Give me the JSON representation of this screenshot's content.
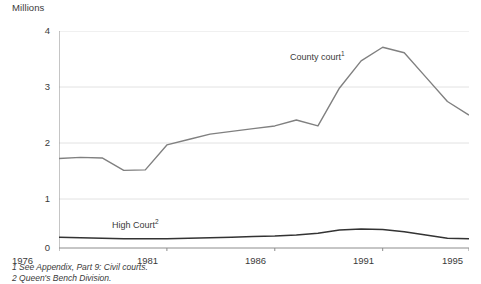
{
  "axis_title": "Millions",
  "footnotes": [
    "1 See Appendix, Part 9: Civil courts.",
    "2 Queen's Bench Division."
  ],
  "labels": {
    "county_court": "County court",
    "county_court_note": "1",
    "high_court": "High Court",
    "high_court_note": "2"
  },
  "yticks": [
    "0",
    "1",
    "2",
    "3",
    "4"
  ],
  "xticks": [
    "1976",
    "1981",
    "1986",
    "1991",
    "1995"
  ],
  "colors": {
    "county_court_line": "#808080",
    "high_court_line": "#333333",
    "gridline": "#e2e2e2",
    "axis": "#8c8c8c",
    "text": "#3a3a3a"
  },
  "chart_data": {
    "type": "line",
    "title": "Millions",
    "xlabel": "",
    "ylabel": "Millions",
    "ylim": [
      0,
      4
    ],
    "xlim": [
      1976,
      1995
    ],
    "ytick_values": [
      0,
      1,
      2,
      3,
      4
    ],
    "xtick_values": [
      1976,
      1981,
      1986,
      1991,
      1995
    ],
    "grid": true,
    "legend": "inline-annotations",
    "x": [
      1976,
      1977,
      1978,
      1979,
      1980,
      1981,
      1982,
      1983,
      1984,
      1985,
      1986,
      1987,
      1988,
      1989,
      1990,
      1991,
      1992,
      1993,
      1994,
      1995
    ],
    "series": [
      {
        "name": "County court",
        "note": "1",
        "color": "#808080",
        "values": [
          1.65,
          1.67,
          1.66,
          1.43,
          1.44,
          1.9,
          2.0,
          2.1,
          2.15,
          2.2,
          2.25,
          2.36,
          2.25,
          2.95,
          3.45,
          3.7,
          3.6,
          3.15,
          2.7,
          2.45
        ]
      },
      {
        "name": "High Court",
        "note": "2",
        "color": "#333333",
        "values": [
          0.2,
          0.19,
          0.18,
          0.17,
          0.17,
          0.17,
          0.18,
          0.19,
          0.2,
          0.21,
          0.22,
          0.24,
          0.27,
          0.33,
          0.35,
          0.34,
          0.3,
          0.24,
          0.18,
          0.17
        ]
      }
    ]
  }
}
